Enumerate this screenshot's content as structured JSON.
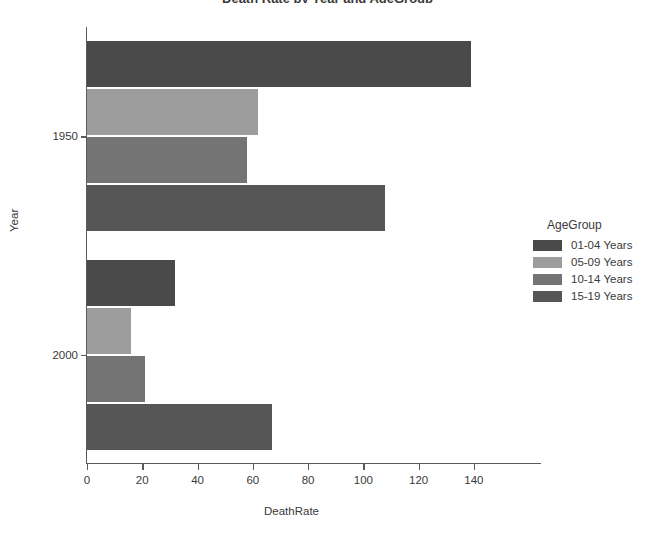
{
  "title_clipped": "Death Rate by Year and AgeGroup",
  "chart_data": {
    "type": "bar",
    "orientation": "horizontal",
    "title": "Death Rate by Year and AgeGroup",
    "xlabel": "DeathRate",
    "ylabel": "Year",
    "categories": [
      "1950",
      "2000"
    ],
    "xlim": [
      0,
      148
    ],
    "xticks": [
      0,
      20,
      40,
      60,
      80,
      100,
      120,
      140
    ],
    "grid": false,
    "legend_title": "AgeGroup",
    "legend_position": "right",
    "series": [
      {
        "name": "01-04 Years",
        "color": "#4a4a4a",
        "values": [
          139,
          32
        ]
      },
      {
        "name": "05-09 Years",
        "color": "#9d9d9d",
        "values": [
          62,
          16
        ]
      },
      {
        "name": "10-14 Years",
        "color": "#747474",
        "values": [
          58,
          21
        ]
      },
      {
        "name": "15-19 Years",
        "color": "#565656",
        "values": [
          108,
          67
        ]
      }
    ]
  }
}
